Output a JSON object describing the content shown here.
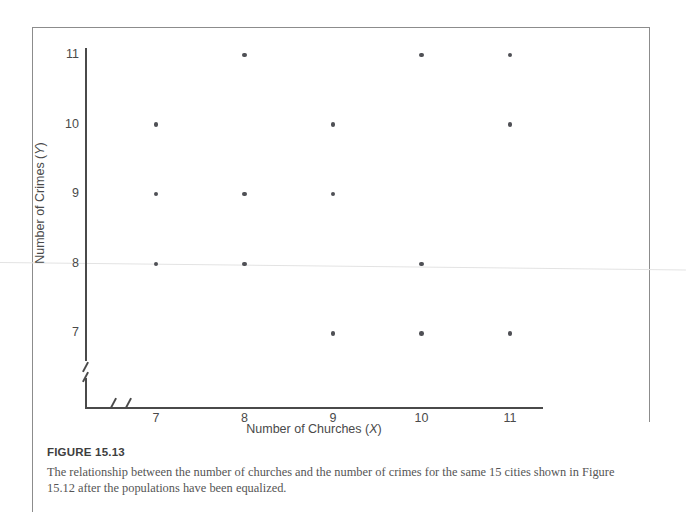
{
  "figure": {
    "number_label": "FIGURE 15.13",
    "caption": "The relationship between the number of churches and the number of crimes for the same 15 cities shown in Figure 15.12 after the populations have been equalized."
  },
  "chart_data": {
    "type": "scatter",
    "title": "",
    "xlabel": "Number of Churches (X)",
    "xlabel_text": "Number of Churches (",
    "xlabel_var": "X",
    "ylabel": "Number of Crimes (Y)",
    "ylabel_text": "Number of Crimes (",
    "ylabel_var": "Y",
    "xticks": [
      7,
      8,
      9,
      10,
      11
    ],
    "yticks": [
      7,
      8,
      9,
      10,
      11
    ],
    "xlim": [
      6.5,
      11.5
    ],
    "ylim": [
      6.5,
      11.5
    ],
    "grid": false,
    "legend": null,
    "axis_break_x": true,
    "axis_break_y": true,
    "n_points": 15,
    "points": [
      {
        "x": 8,
        "y": 11
      },
      {
        "x": 10,
        "y": 11
      },
      {
        "x": 11,
        "y": 11
      },
      {
        "x": 7,
        "y": 10
      },
      {
        "x": 9,
        "y": 10
      },
      {
        "x": 11,
        "y": 10
      },
      {
        "x": 7,
        "y": 9
      },
      {
        "x": 8,
        "y": 9
      },
      {
        "x": 9,
        "y": 9
      },
      {
        "x": 7,
        "y": 8
      },
      {
        "x": 8,
        "y": 8
      },
      {
        "x": 10,
        "y": 8
      },
      {
        "x": 9,
        "y": 7
      },
      {
        "x": 10,
        "y": 7
      },
      {
        "x": 11,
        "y": 7
      }
    ],
    "trendline": {
      "visible": true,
      "start": {
        "x": 6.3,
        "y": 8.05
      },
      "end": {
        "x": 11.9,
        "y": 7.7
      },
      "color": "#e3e3e3"
    },
    "point_color": "#4f5055",
    "axis_color": "#4a4a4a"
  }
}
